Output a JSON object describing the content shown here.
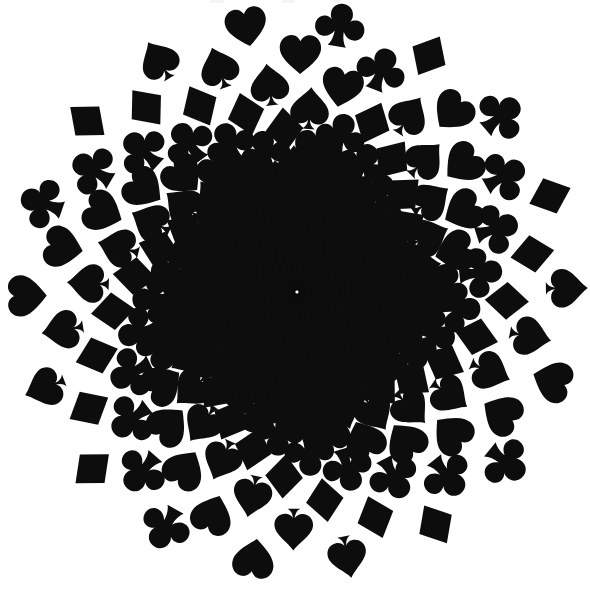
{
  "document": {
    "title": "Playing Card Suit Spiral",
    "width": 590,
    "height": 589,
    "background_color": "#ffffff"
  },
  "artwork": {
    "name": "suit-spiral",
    "description": "Concentric logarithmic spiral of playing-card suit symbols radiating from a dense center to a large circular rim",
    "ink_color": "#0d0d0d",
    "paper_color": "#ffffff",
    "center_x": 297,
    "center_y": 292,
    "outer_radius": 272,
    "inner_radius": 2.2,
    "arm_count": 18,
    "rings": 42,
    "rotation_per_ring_deg": 8.4,
    "growth_per_ring": 1.135,
    "shape_scale_ratio": 0.62,
    "max_shape_size": 46,
    "suit_cycle": [
      "spade",
      "heart",
      "club",
      "diamond"
    ],
    "suits": [
      {
        "name": "spade",
        "glyph": "♠",
        "label": "Spade"
      },
      {
        "name": "heart",
        "glyph": "♥",
        "label": "Heart"
      },
      {
        "name": "club",
        "glyph": "♣",
        "label": "Club"
      },
      {
        "name": "diamond",
        "glyph": "♦",
        "label": "Diamond"
      }
    ],
    "top_edge_artifacts": [
      {
        "x": 210,
        "width": 14
      },
      {
        "x": 282,
        "width": 13
      },
      {
        "x": 334,
        "width": 7
      }
    ]
  }
}
